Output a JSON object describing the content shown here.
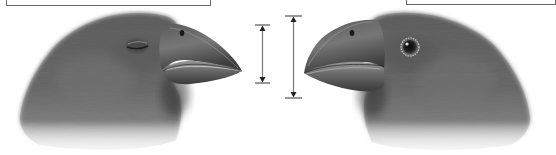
{
  "figure": {
    "type": "illustration",
    "label_boxes": [
      {
        "id": "left",
        "text": "",
        "visible": "bottom edge only (cropped)"
      },
      {
        "id": "right",
        "text": "",
        "visible": "bottom edge only (cropped)"
      }
    ],
    "birds": [
      {
        "id": "left-finch",
        "facing": "right",
        "eye": "closed",
        "beak_depth_marker": "shorter"
      },
      {
        "id": "right-finch",
        "facing": "left",
        "eye": "open",
        "beak_depth_marker": "longer"
      }
    ],
    "measurement_markers": [
      {
        "id": "left-beak-depth",
        "x": 262,
        "y_top": 25,
        "y_bottom": 83
      },
      {
        "id": "right-beak-depth",
        "x": 293,
        "y_top": 16,
        "y_bottom": 98
      }
    ],
    "colors": {
      "feather_dark": "#4a4a4a",
      "feather_mid": "#6e6e6e",
      "beak_dark": "#3c3c3c",
      "beak_light": "#8a8a8a",
      "marker_line": "#7a7a7a",
      "marker_cap": "#333333",
      "background": "#ffffff"
    }
  }
}
